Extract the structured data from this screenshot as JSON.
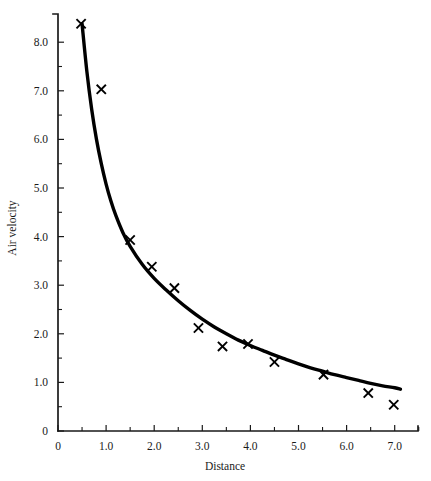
{
  "chart_data": {
    "type": "scatter",
    "title": "",
    "xlabel": "Distance",
    "ylabel": "Air velocity",
    "xlim": [
      0,
      7.5
    ],
    "ylim": [
      0,
      8.7
    ],
    "grid": false,
    "legend": "none",
    "x_ticks_major": [
      0,
      1.0,
      2.0,
      3.0,
      4.0,
      5.0,
      6.0,
      7.0
    ],
    "x_tick_labels": [
      "0",
      "1.0",
      "2.0",
      "3.0",
      "4.0",
      "5.0",
      "6.0",
      "7.0"
    ],
    "x_ticks_minor": [
      0.5,
      1.5,
      2.5,
      3.5,
      4.5,
      5.5,
      6.5,
      7.5
    ],
    "y_ticks_major": [
      0,
      1.0,
      2.0,
      3.0,
      4.0,
      5.0,
      6.0,
      7.0,
      8.0
    ],
    "y_tick_labels": [
      "0",
      "1.0",
      "2.0",
      "3.0",
      "4.0",
      "5.0",
      "6.0",
      "7.0",
      "8.0"
    ],
    "y_ticks_minor": [
      0.5,
      1.5,
      2.5,
      3.5,
      4.5,
      5.5,
      6.5,
      7.5
    ],
    "series": [
      {
        "name": "measured",
        "marker": "x",
        "points": [
          {
            "x": 0.48,
            "y": 8.38
          },
          {
            "x": 0.9,
            "y": 7.03
          },
          {
            "x": 1.5,
            "y": 3.93
          },
          {
            "x": 1.95,
            "y": 3.38
          },
          {
            "x": 2.42,
            "y": 2.94
          },
          {
            "x": 2.92,
            "y": 2.12
          },
          {
            "x": 3.42,
            "y": 1.74
          },
          {
            "x": 3.95,
            "y": 1.79
          },
          {
            "x": 4.5,
            "y": 1.42
          },
          {
            "x": 5.52,
            "y": 1.16
          },
          {
            "x": 6.45,
            "y": 0.78
          },
          {
            "x": 6.98,
            "y": 0.54
          }
        ]
      },
      {
        "name": "fitted-curve",
        "marker": "none",
        "curve": [
          {
            "x": 0.5,
            "y": 8.38
          },
          {
            "x": 0.6,
            "y": 7.4
          },
          {
            "x": 0.7,
            "y": 6.62
          },
          {
            "x": 0.8,
            "y": 6.0
          },
          {
            "x": 0.9,
            "y": 5.5
          },
          {
            "x": 1.0,
            "y": 5.08
          },
          {
            "x": 1.1,
            "y": 4.73
          },
          {
            "x": 1.2,
            "y": 4.44
          },
          {
            "x": 1.35,
            "y": 4.08
          },
          {
            "x": 1.5,
            "y": 3.8
          },
          {
            "x": 1.75,
            "y": 3.43
          },
          {
            "x": 2.0,
            "y": 3.14
          },
          {
            "x": 2.25,
            "y": 2.9
          },
          {
            "x": 2.5,
            "y": 2.68
          },
          {
            "x": 2.75,
            "y": 2.48
          },
          {
            "x": 3.0,
            "y": 2.3
          },
          {
            "x": 3.25,
            "y": 2.14
          },
          {
            "x": 3.5,
            "y": 2.0
          },
          {
            "x": 3.75,
            "y": 1.87
          },
          {
            "x": 4.0,
            "y": 1.76
          },
          {
            "x": 4.25,
            "y": 1.66
          },
          {
            "x": 4.5,
            "y": 1.56
          },
          {
            "x": 4.75,
            "y": 1.47
          },
          {
            "x": 5.0,
            "y": 1.38
          },
          {
            "x": 5.25,
            "y": 1.3
          },
          {
            "x": 5.5,
            "y": 1.23
          },
          {
            "x": 5.75,
            "y": 1.16
          },
          {
            "x": 6.0,
            "y": 1.1
          },
          {
            "x": 6.25,
            "y": 1.04
          },
          {
            "x": 6.5,
            "y": 0.98
          },
          {
            "x": 6.75,
            "y": 0.93
          },
          {
            "x": 7.0,
            "y": 0.89
          },
          {
            "x": 7.12,
            "y": 0.86
          }
        ]
      }
    ]
  },
  "colors": {
    "axis": "#1a1a1a",
    "curve": "#000000",
    "marker": "#000000",
    "background": "#ffffff"
  },
  "geometry": {
    "origin_x_px": 58,
    "origin_y_px": 431,
    "x_unit_px": 48.1,
    "y_unit_px": 48.6,
    "axis_top_y_px": 14,
    "axis_right_x_px": 418
  }
}
